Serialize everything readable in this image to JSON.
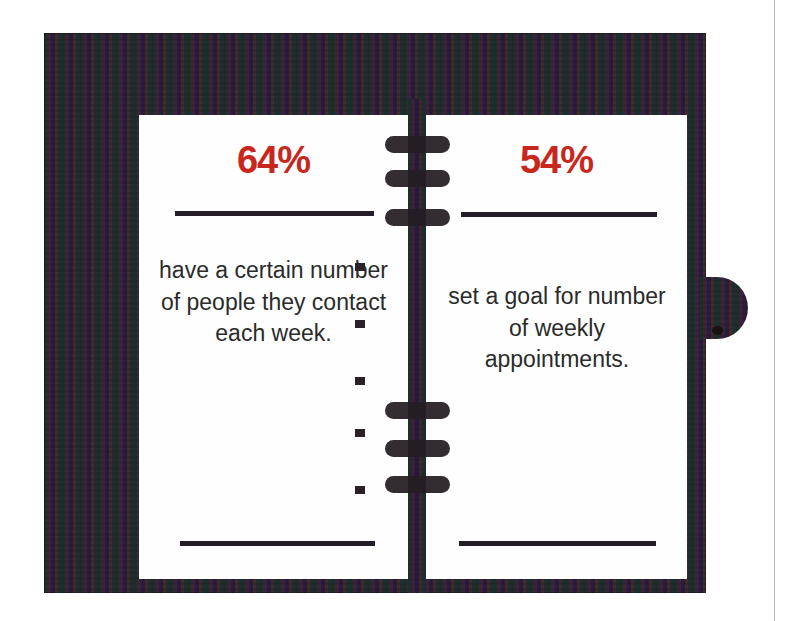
{
  "graphic": {
    "type": "statistic-infographic",
    "subject": "planner-notebook",
    "colors": {
      "accent_red": "#C8271E",
      "cover_dark": "#3B3040",
      "page_white": "#FEFEFE",
      "rule_dark": "#241D28",
      "text_dark": "#2B2B2B"
    }
  },
  "planner": {
    "spine": {
      "icon": "spiral-binding-icon",
      "ring_count": 6
    },
    "closure_tab": {
      "icon": "elastic-closure-tab-icon"
    },
    "gutter_bullets": {
      "icon": "bullet-square-icon",
      "count": 5
    }
  },
  "left_page": {
    "percent": "64%",
    "statement": "have a certain number of people they contact each week."
  },
  "right_page": {
    "percent": "54%",
    "statement": "set a goal for number of weekly appointments."
  }
}
